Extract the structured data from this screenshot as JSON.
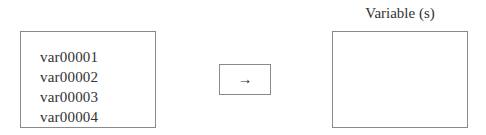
{
  "source": {
    "items": [
      {
        "label": "var00001"
      },
      {
        "label": "var00002"
      },
      {
        "label": "var00003"
      },
      {
        "label": "var00004"
      }
    ]
  },
  "move_button": {
    "icon": "right-arrow-icon",
    "glyph": "→"
  },
  "target": {
    "label": "Variable (s)",
    "items": []
  }
}
